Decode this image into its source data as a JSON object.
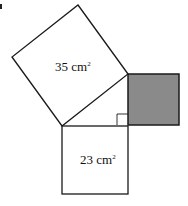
{
  "diagram": {
    "type": "pythagoras-squares",
    "squares": [
      {
        "id": "hypotenuse-square",
        "label": "35 cm",
        "unit_power": "2",
        "shaded": false
      },
      {
        "id": "leg-square-bottom",
        "label": "23 cm",
        "unit_power": "2",
        "shaded": false
      },
      {
        "id": "leg-square-right",
        "label": "",
        "shaded": true
      }
    ],
    "colors": {
      "stroke": "#1a1a1a",
      "shade": "#8a8a8a",
      "background": "#ffffff"
    }
  }
}
